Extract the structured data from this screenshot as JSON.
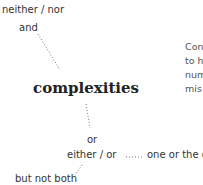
{
  "diagram": {
    "center": "complexities",
    "nodes": {
      "neither_nor": "neither / nor",
      "and": "and",
      "or": "or",
      "either_or": "either / or",
      "one_or_the_other": "one or the o",
      "but_not_both": "but not both"
    },
    "paragraph": [
      "Con",
      "to h",
      "num",
      "mis"
    ]
  }
}
